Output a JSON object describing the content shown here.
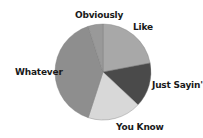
{
  "chart_data": {
    "type": "pie",
    "title": "",
    "start_angle_deg": 0,
    "direction": "clockwise",
    "categories": [
      "Like",
      "Just Sayin'",
      "You Know",
      "Whatever",
      "Obviously"
    ],
    "values": [
      22,
      15,
      18,
      40,
      5
    ],
    "colors": [
      "#a8a8a8",
      "#4a4a4a",
      "#d8d8d8",
      "#8e8e8e",
      "#999999"
    ],
    "legend": "none (labels placed outside slices)",
    "labels": [
      {
        "text": "Like",
        "x": 133,
        "y": 22
      },
      {
        "text": "Just Sayin'",
        "x": 152,
        "y": 80
      },
      {
        "text": "You Know",
        "x": 116,
        "y": 122
      },
      {
        "text": "Whatever",
        "x": 15,
        "y": 67
      },
      {
        "text": "Obviously",
        "x": 75,
        "y": 10
      }
    ]
  }
}
